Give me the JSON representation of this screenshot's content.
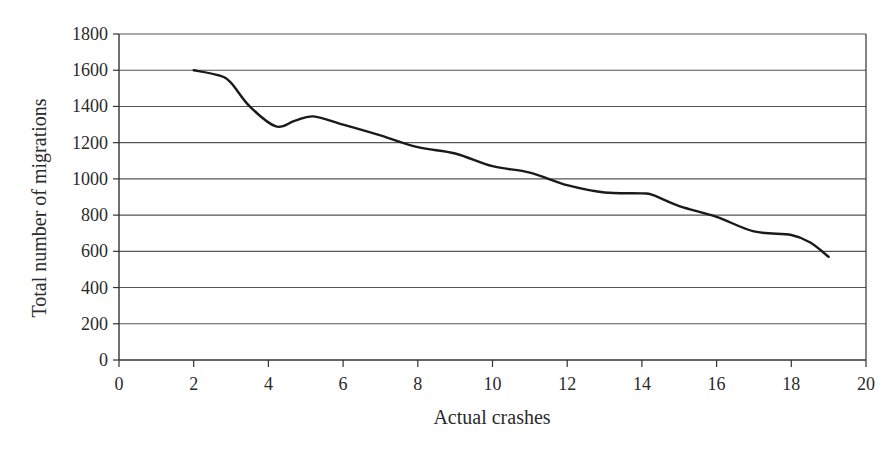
{
  "chart_data": {
    "type": "line",
    "title": "",
    "xlabel": "Actual crashes",
    "ylabel": "Total number of migrations",
    "xlim": [
      0,
      20
    ],
    "ylim": [
      0,
      1800
    ],
    "x_ticks": [
      0,
      2,
      4,
      6,
      8,
      10,
      12,
      14,
      16,
      18,
      20
    ],
    "y_ticks": [
      0,
      200,
      400,
      600,
      800,
      1000,
      1200,
      1400,
      1600,
      1800
    ],
    "grid": {
      "horizontal": true,
      "vertical": false
    },
    "legend": null,
    "series": [
      {
        "name": "Total number of migrations",
        "color": "#1a1a1a",
        "smooth": true,
        "x": [
          2,
          2.7,
          3,
          3.5,
          4.2,
          4.7,
          5.2,
          6,
          7,
          8,
          9,
          10,
          11,
          12,
          13,
          14,
          14.3,
          15,
          16,
          17,
          18,
          18.5,
          19
        ],
        "y": [
          1600,
          1570,
          1530,
          1400,
          1290,
          1320,
          1345,
          1300,
          1240,
          1175,
          1140,
          1070,
          1035,
          965,
          925,
          920,
          910,
          850,
          790,
          710,
          690,
          650,
          570
        ]
      }
    ]
  },
  "colors": {
    "line": "#1a1a1a",
    "grid": "#555555",
    "axis": "#333333",
    "text": "#2a2a2a",
    "background": "#ffffff"
  }
}
